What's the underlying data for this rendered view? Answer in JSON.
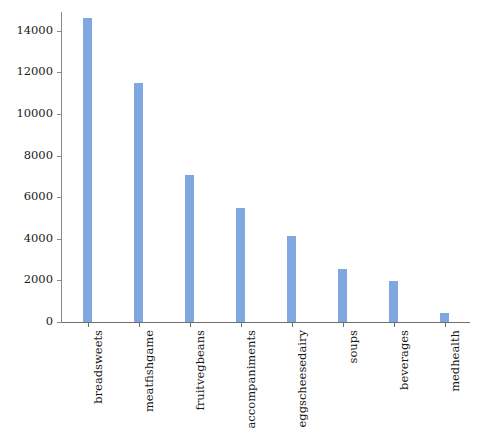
{
  "chart_data": {
    "type": "bar",
    "title": "",
    "xlabel": "",
    "ylabel": "",
    "categories": [
      "breadsweets",
      "meatfishgame",
      "fruitvegbeans",
      "accompaniments",
      "eggscheesedairy",
      "soups",
      "beverages",
      "medhealth"
    ],
    "values": [
      14600,
      11500,
      7050,
      5500,
      4150,
      2550,
      1950,
      450
    ],
    "ylim": [
      0,
      14900
    ],
    "yticks": [
      0,
      2000,
      4000,
      6000,
      8000,
      10000,
      12000,
      14000
    ],
    "ytick_labels": [
      "0",
      "2000",
      "4000",
      "6000",
      "8000",
      "10000",
      "12000",
      "14000"
    ],
    "grid": false,
    "legend": null,
    "bar_color": "#7fa8e0",
    "axis_color": "#8a8a8a",
    "background": "#ffffff"
  }
}
